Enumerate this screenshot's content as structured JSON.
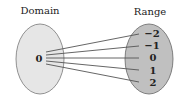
{
  "diagram": {
    "domain_label": "Domain",
    "range_label": "Range",
    "domain_values": [
      "0"
    ],
    "range_values": [
      "−2",
      "−1",
      "0",
      "1",
      "2"
    ],
    "mappings": [
      {
        "from": "0",
        "to": "−2"
      },
      {
        "from": "0",
        "to": "−1"
      },
      {
        "from": "0",
        "to": "0"
      },
      {
        "from": "0",
        "to": "1"
      },
      {
        "from": "0",
        "to": "2"
      }
    ],
    "colors": {
      "domain_fill": "#e6e6e6",
      "range_fill": "#bfbfbf",
      "stroke": "#666666",
      "arrow": "#555555"
    }
  }
}
